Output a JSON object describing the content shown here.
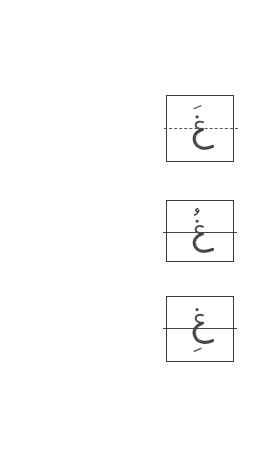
{
  "page": {
    "background": "#ffffff"
  },
  "letter_boxes": [
    {
      "letter": "غَ",
      "base_letter": "غ",
      "diacritic": "fatha",
      "midline_style": "dashed",
      "border_color": "#3a3a3a",
      "glyph_color": "#555555"
    },
    {
      "letter": "غُ",
      "base_letter": "غ",
      "diacritic": "damma",
      "midline_style": "solid",
      "border_color": "#3a3a3a",
      "glyph_color": "#555555"
    },
    {
      "letter": "غِ",
      "base_letter": "غ",
      "diacritic": "kasra",
      "midline_style": "solid",
      "border_color": "#3a3a3a",
      "glyph_color": "#555555"
    }
  ]
}
